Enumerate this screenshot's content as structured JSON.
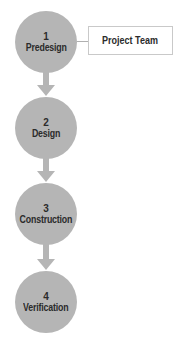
{
  "diagram": {
    "stages": [
      {
        "number": "1",
        "label": "Predesign"
      },
      {
        "number": "2",
        "label": "Design"
      },
      {
        "number": "3",
        "label": "Construction"
      },
      {
        "number": "4",
        "label": "Verification"
      }
    ],
    "side_box": {
      "label": "Project Team",
      "attached_to_stage": "1"
    },
    "colors": {
      "circle_fill": "#b5b5b5",
      "arrow_fill": "#b5b5b5",
      "text": "#2b2b2b",
      "box_border": "#c9c9c9",
      "connector": "#b0b0b0",
      "background": "#ffffff"
    }
  }
}
